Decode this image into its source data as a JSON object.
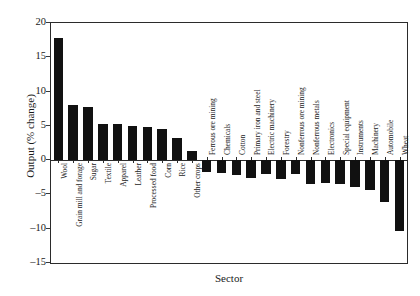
{
  "chart_data": {
    "type": "bar",
    "title": "",
    "xlabel": "Sector",
    "ylabel": "Output (% change)",
    "ylim": [
      -15,
      20
    ],
    "ytick_step": 5,
    "yticks": [
      "20",
      "15",
      "10",
      "5",
      "0",
      "-5",
      "-10",
      "-15"
    ],
    "grid": false,
    "legend": "none",
    "bar_color": "#111111",
    "axis_color": "#2b2b2b",
    "categories": [
      "Wool",
      "Grain mill and forage",
      "Sugar",
      "Textile",
      "Apparel",
      "Leather",
      "Processed food",
      "Corn",
      "Rice",
      "Other crops",
      "Ferrous ore mining",
      "Chemicals",
      "Cotton",
      "Primary iron and steel",
      "Electric machinery",
      "Forestry",
      "Nonferrous ore mining",
      "Nonferrous metals",
      "Electronics",
      "Special equipment",
      "Instruments",
      "Machinery",
      "Automobile",
      "Wheat"
    ],
    "values": [
      17.8,
      8.0,
      7.8,
      5.2,
      5.2,
      5.0,
      4.8,
      4.6,
      3.3,
      1.3,
      -1.8,
      -1.9,
      -2.1,
      -2.6,
      -2.0,
      -2.7,
      -2.0,
      -3.5,
      -3.4,
      -3.5,
      -3.9,
      -4.3,
      -6.1,
      -10.4
    ]
  }
}
